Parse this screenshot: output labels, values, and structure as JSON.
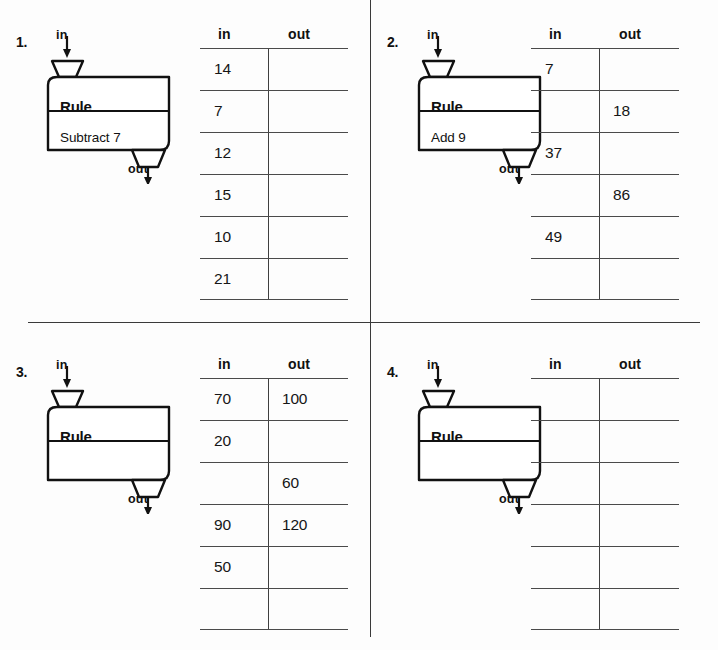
{
  "page": {
    "clipped_header_text": "",
    "background_color": "#fdfdfd",
    "rule_line_color": "#3a3a3a"
  },
  "table_headers": {
    "in": "in",
    "out": "out"
  },
  "machine_labels": {
    "in": "in",
    "out": "out",
    "rule_title": "Rule"
  },
  "problems": [
    {
      "number": "1.",
      "rule_title": "Rule",
      "rule_text": "Subtract 7",
      "label_in": "in",
      "label_out": "out",
      "columns": {
        "in": "in",
        "out": "out"
      },
      "rows": [
        {
          "in": "14",
          "out": ""
        },
        {
          "in": "7",
          "out": ""
        },
        {
          "in": "12",
          "out": ""
        },
        {
          "in": "15",
          "out": ""
        },
        {
          "in": "10",
          "out": ""
        },
        {
          "in": "21",
          "out": ""
        }
      ]
    },
    {
      "number": "2.",
      "rule_title": "Rule",
      "rule_text": "Add 9",
      "label_in": "in",
      "label_out": "out",
      "columns": {
        "in": "in",
        "out": "out"
      },
      "rows": [
        {
          "in": "7",
          "out": ""
        },
        {
          "in": "",
          "out": "18"
        },
        {
          "in": "37",
          "out": ""
        },
        {
          "in": "",
          "out": "86"
        },
        {
          "in": "49",
          "out": ""
        },
        {
          "in": "",
          "out": ""
        }
      ]
    },
    {
      "number": "3.",
      "rule_title": "Rule",
      "rule_text": "",
      "label_in": "in",
      "label_out": "out",
      "columns": {
        "in": "in",
        "out": "out"
      },
      "rows": [
        {
          "in": "70",
          "out": "100"
        },
        {
          "in": "20",
          "out": ""
        },
        {
          "in": "",
          "out": "60"
        },
        {
          "in": "90",
          "out": "120"
        },
        {
          "in": "50",
          "out": ""
        },
        {
          "in": "",
          "out": ""
        }
      ]
    },
    {
      "number": "4.",
      "rule_title": "Rule",
      "rule_text": "",
      "label_in": "in",
      "label_out": "out",
      "columns": {
        "in": "in",
        "out": "out"
      },
      "rows": [
        {
          "in": "",
          "out": ""
        },
        {
          "in": "",
          "out": ""
        },
        {
          "in": "",
          "out": ""
        },
        {
          "in": "",
          "out": ""
        },
        {
          "in": "",
          "out": ""
        },
        {
          "in": "",
          "out": ""
        }
      ]
    }
  ]
}
